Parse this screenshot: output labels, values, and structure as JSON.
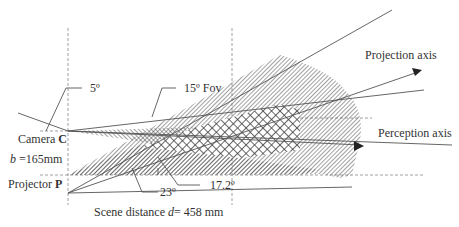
{
  "diagram": {
    "type": "camera-projector triangulation geometry",
    "colors": {
      "line": "#555555",
      "hatch": "#444444",
      "background": "#ffffff"
    },
    "labels": {
      "camera_angle": "5º",
      "fov": "15º Fov",
      "projection_axis": "Projection axis",
      "perception_axis": "Perception axis",
      "camera_prefix": "Camera",
      "camera_symbol": "C",
      "baseline_var": "b",
      "baseline_value": " =165mm",
      "projector_prefix": "Projector",
      "projector_symbol": "P",
      "projector_angle": "23º",
      "axis_angle": "17.2º",
      "scene_prefix": "Scene distance ",
      "scene_var": "d",
      "scene_value": "= 458 mm"
    },
    "points": {
      "camera": [
        68,
        131
      ],
      "projector": [
        68,
        193
      ],
      "scene_x": 232
    }
  }
}
